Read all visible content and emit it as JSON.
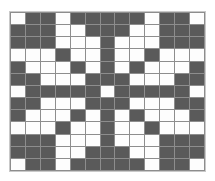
{
  "figure": {
    "kind": "grid-pattern",
    "rows": 13,
    "columns": 13,
    "colors": {
      "dark_cell": "#5a5a5a",
      "light_cell": "#fdfdfd",
      "gridline": "#8d8d8d",
      "background": "#ffffff",
      "border": "#c9c9c9"
    },
    "legend": {
      "dark_symbol": "D",
      "light_symbol": "W"
    }
  },
  "chart_data": {
    "type": "heatmap",
    "title": "",
    "xlabel": "",
    "ylabel": "",
    "grid": true,
    "legend_position": "none",
    "categories_x": [
      "1",
      "2",
      "3",
      "4",
      "5",
      "6",
      "7",
      "8",
      "9",
      "10",
      "11",
      "12",
      "13"
    ],
    "categories_y": [
      "1",
      "2",
      "3",
      "4",
      "5",
      "6",
      "7",
      "8",
      "9",
      "10",
      "11",
      "12",
      "13"
    ],
    "value_labels": {
      "0": "light",
      "1": "dark"
    },
    "matrix": [
      [
        0,
        1,
        1,
        0,
        1,
        1,
        1,
        1,
        1,
        0,
        1,
        1,
        0
      ],
      [
        1,
        1,
        1,
        0,
        0,
        1,
        1,
        1,
        0,
        0,
        1,
        1,
        1
      ],
      [
        1,
        1,
        1,
        0,
        0,
        0,
        1,
        0,
        0,
        0,
        1,
        1,
        1
      ],
      [
        0,
        0,
        0,
        1,
        0,
        0,
        1,
        0,
        0,
        1,
        0,
        0,
        0
      ],
      [
        1,
        0,
        0,
        0,
        1,
        0,
        1,
        0,
        1,
        0,
        0,
        0,
        1
      ],
      [
        1,
        1,
        0,
        0,
        0,
        1,
        1,
        1,
        0,
        0,
        0,
        1,
        1
      ],
      [
        0,
        1,
        1,
        1,
        1,
        1,
        0,
        1,
        1,
        1,
        1,
        1,
        0
      ],
      [
        1,
        1,
        0,
        0,
        0,
        1,
        1,
        1,
        0,
        0,
        0,
        1,
        1
      ],
      [
        1,
        0,
        0,
        0,
        1,
        0,
        1,
        0,
        1,
        0,
        0,
        0,
        1
      ],
      [
        0,
        0,
        0,
        1,
        0,
        0,
        1,
        0,
        0,
        1,
        0,
        0,
        0
      ],
      [
        1,
        1,
        1,
        0,
        0,
        0,
        1,
        0,
        0,
        0,
        1,
        1,
        1
      ],
      [
        1,
        1,
        1,
        0,
        0,
        1,
        1,
        1,
        0,
        0,
        1,
        1,
        1
      ],
      [
        0,
        1,
        1,
        0,
        1,
        1,
        1,
        1,
        1,
        0,
        1,
        1,
        0
      ]
    ]
  }
}
